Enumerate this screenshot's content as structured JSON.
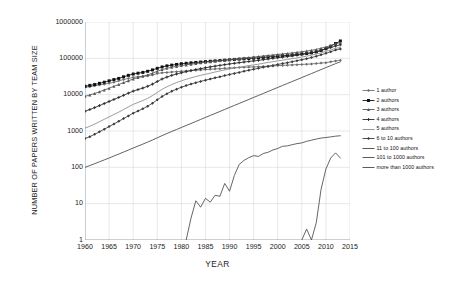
{
  "chart_data": {
    "type": "line",
    "title": "",
    "xlabel": "YEAR",
    "ylabel": "NUMBER OF PAPERS WRITTEN BY TEAM SIZE",
    "xlim": [
      1960,
      2015
    ],
    "ylim": [
      1,
      1000000
    ],
    "yscale": "log",
    "grid": true,
    "legend_position": "right",
    "xticks": [
      1960,
      1965,
      1970,
      1975,
      1980,
      1985,
      1990,
      1995,
      2000,
      2005,
      2010,
      2015
    ],
    "yticks": [
      1,
      10,
      100,
      1000,
      10000,
      100000,
      1000000
    ],
    "ytick_labels": [
      "1",
      "10",
      "100",
      "1000",
      "10000",
      "100000",
      "1000000"
    ],
    "xtick_labels": [
      "1960",
      "1965",
      "1970",
      "1975",
      "1980",
      "1985",
      "1990",
      "1995",
      "2000",
      "2005",
      "2010",
      "2015"
    ],
    "x": [
      1960,
      1961,
      1962,
      1963,
      1964,
      1965,
      1966,
      1967,
      1968,
      1969,
      1970,
      1971,
      1972,
      1973,
      1974,
      1975,
      1976,
      1977,
      1978,
      1979,
      1980,
      1981,
      1982,
      1983,
      1984,
      1985,
      1986,
      1987,
      1988,
      1989,
      1990,
      1991,
      1992,
      1993,
      1994,
      1995,
      1996,
      1997,
      1998,
      1999,
      2000,
      2001,
      2002,
      2003,
      2004,
      2005,
      2006,
      2007,
      2008,
      2009,
      2010,
      2011,
      2012,
      2013
    ],
    "series": [
      {
        "name": "1 author",
        "marker": "diamond",
        "color": "#6e6e6e",
        "values": [
          16000,
          16500,
          17500,
          18500,
          19500,
          20500,
          22000,
          24000,
          26000,
          28000,
          30000,
          31000,
          32000,
          33000,
          35000,
          38000,
          40000,
          41000,
          42000,
          43000,
          44000,
          45000,
          46000,
          47000,
          48000,
          49000,
          50000,
          51000,
          52000,
          53000,
          54000,
          55000,
          56000,
          57000,
          57500,
          58000,
          59000,
          60000,
          61000,
          62000,
          63000,
          64000,
          65000,
          66000,
          67000,
          68000,
          69000,
          70000,
          72000,
          74000,
          76000,
          80000,
          85000,
          88000
        ]
      },
      {
        "name": "2 authors",
        "marker": "square",
        "color": "#111111",
        "values": [
          17000,
          18000,
          19000,
          20500,
          22000,
          24000,
          26000,
          28000,
          31000,
          34000,
          37000,
          39000,
          41000,
          44000,
          48000,
          53000,
          58000,
          62000,
          65000,
          68000,
          71000,
          73000,
          75000,
          77000,
          79000,
          81000,
          83000,
          85000,
          87000,
          89000,
          91000,
          93000,
          95000,
          97000,
          99000,
          101000,
          103000,
          106000,
          109000,
          112000,
          115000,
          118000,
          121000,
          124000,
          128000,
          132000,
          136000,
          142000,
          150000,
          165000,
          185000,
          215000,
          255000,
          300000
        ]
      },
      {
        "name": "3 authors",
        "marker": "triangle",
        "color": "#555555",
        "values": [
          9000,
          9800,
          10800,
          12000,
          13500,
          15000,
          17000,
          19000,
          21500,
          24000,
          27000,
          29500,
          32000,
          35000,
          39000,
          44000,
          49000,
          53000,
          57000,
          60000,
          63000,
          66000,
          69000,
          72000,
          75000,
          78000,
          81000,
          84000,
          87000,
          90000,
          93000,
          96000,
          99000,
          102000,
          105000,
          108000,
          112000,
          116000,
          120000,
          124000,
          128000,
          132000,
          136000,
          141000,
          146000,
          152000,
          158000,
          166000,
          176000,
          190000,
          205000,
          225000,
          250000,
          270000
        ]
      },
      {
        "name": "4 authors",
        "marker": "cross",
        "color": "#2a2a2a",
        "values": [
          3500,
          3900,
          4400,
          5000,
          5700,
          6500,
          7400,
          8400,
          9600,
          11000,
          12500,
          13800,
          15200,
          17000,
          19500,
          23000,
          27000,
          30500,
          34000,
          37000,
          40000,
          43000,
          46000,
          49000,
          52000,
          55000,
          58000,
          61000,
          64000,
          67000,
          70000,
          73000,
          76000,
          79000,
          82000,
          85000,
          88000,
          92000,
          96000,
          100000,
          104000,
          108000,
          112000,
          117000,
          122000,
          128000,
          134000,
          142000,
          152000,
          165000,
          180000,
          198000,
          218000,
          235000
        ]
      },
      {
        "name": "5 authors",
        "marker": "none",
        "color": "#8a8a8a",
        "values": [
          1200,
          1350,
          1550,
          1800,
          2100,
          2450,
          2850,
          3300,
          3900,
          4600,
          5400,
          6100,
          6900,
          7900,
          9400,
          11500,
          14000,
          16500,
          19000,
          21500,
          24000,
          26500,
          29000,
          31500,
          34000,
          36500,
          39000,
          42000,
          45000,
          48000,
          51000,
          54000,
          57000,
          60000,
          63000,
          66000,
          69000,
          73000,
          77000,
          81000,
          85000,
          89000,
          93000,
          98000,
          103000,
          109000,
          115000,
          122000,
          131000,
          142000,
          155000,
          170000,
          188000,
          200000
        ]
      },
      {
        "name": "6 to 10 authors",
        "marker": "diamond",
        "color": "#3a3a3a",
        "values": [
          620,
          700,
          810,
          950,
          1120,
          1320,
          1560,
          1850,
          2200,
          2600,
          3100,
          3550,
          4100,
          4800,
          5800,
          7200,
          8900,
          10600,
          12400,
          14200,
          16000,
          17800,
          19600,
          21400,
          23200,
          25000,
          27000,
          29000,
          31000,
          33500,
          36000,
          38500,
          41000,
          44000,
          47000,
          50000,
          53000,
          56500,
          60000,
          64000,
          68000,
          72000,
          76000,
          81000,
          86000,
          92000,
          98000,
          105000,
          114000,
          125000,
          137000,
          152000,
          170000,
          182000
        ]
      },
      {
        "name": "11 to 100 authors",
        "marker": "none",
        "color": "#444444",
        "values": [
          100,
          112,
          126,
          142,
          160,
          180,
          205,
          232,
          263,
          298,
          340,
          385,
          435,
          495,
          565,
          650,
          745,
          850,
          970,
          1100,
          1250,
          1420,
          1610,
          1830,
          2080,
          2360,
          2680,
          3040,
          3450,
          3920,
          4450,
          5050,
          5730,
          6500,
          7380,
          8380,
          9510,
          10800,
          12250,
          13900,
          15800,
          17900,
          20300,
          23000,
          26100,
          29600,
          33600,
          38100,
          43200,
          49000,
          55600,
          63000,
          71500,
          80000
        ]
      },
      {
        "name": "101 to 1000 authors",
        "marker": "none",
        "color": "#4a4a4a",
        "values": [
          null,
          null,
          null,
          null,
          null,
          null,
          null,
          null,
          null,
          null,
          null,
          null,
          null,
          null,
          null,
          null,
          null,
          null,
          null,
          null,
          null,
          1,
          4,
          12,
          8,
          14,
          11,
          17,
          16,
          36,
          22,
          60,
          120,
          155,
          185,
          210,
          200,
          240,
          260,
          300,
          330,
          380,
          390,
          420,
          450,
          470,
          520,
          560,
          600,
          640,
          660,
          690,
          720,
          740
        ]
      },
      {
        "name": "more than 1000 authors",
        "marker": "none",
        "color": "#4a4a4a",
        "values": [
          null,
          null,
          null,
          null,
          null,
          null,
          null,
          null,
          null,
          null,
          null,
          null,
          null,
          null,
          null,
          null,
          null,
          null,
          null,
          null,
          null,
          null,
          null,
          null,
          null,
          null,
          null,
          null,
          null,
          null,
          null,
          null,
          null,
          null,
          null,
          null,
          null,
          null,
          null,
          null,
          null,
          null,
          null,
          null,
          null,
          1,
          2,
          1,
          3,
          25,
          90,
          180,
          250,
          180
        ]
      }
    ]
  },
  "legend": {
    "items": [
      {
        "label": "1 author"
      },
      {
        "label": "2 authors"
      },
      {
        "label": "3 authors"
      },
      {
        "label": "4 authors"
      },
      {
        "label": "5 authors"
      },
      {
        "label": "6 to 10 authors"
      },
      {
        "label": "11 to 100 authors"
      },
      {
        "label": "101 to 1000 authors"
      },
      {
        "label": "more than 1000 authors"
      }
    ]
  }
}
